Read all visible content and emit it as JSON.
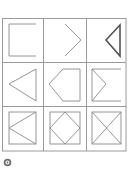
{
  "puzzle": {
    "type": "3x3 figure matrix",
    "grid": {
      "left": 2,
      "top": 18,
      "right": 126,
      "bottom": 151,
      "cols": [
        2,
        43,
        86,
        126
      ],
      "rows": [
        18,
        62,
        106,
        151
      ]
    },
    "line_color": "#8a8a8a",
    "grid_color": "#9a9a9a",
    "cells": [
      {
        "name": "square-open-right",
        "description": "Square missing the right side"
      },
      {
        "name": "chevron-right",
        "description": "Right-pointing chevron (two lines)"
      },
      {
        "name": "triangle-left-bold",
        "description": "Left-pointing triangle, bold outline"
      },
      {
        "name": "triangle-left",
        "description": "Left-pointing triangle"
      },
      {
        "name": "pentagon-left",
        "description": "House-shaped pentagon pointing left"
      },
      {
        "name": "square-open-with-inner-chevron",
        "description": "Square open on right with inner right-pointing chevron"
      },
      {
        "name": "square-with-left-triangle",
        "description": "Square with inscribed left-pointing triangle"
      },
      {
        "name": "square-with-diamond",
        "description": "Square with inscribed diamond"
      },
      {
        "name": "square-with-x",
        "description": "Square with both diagonals"
      }
    ]
  },
  "footer": {
    "icon": "gear-icon"
  }
}
